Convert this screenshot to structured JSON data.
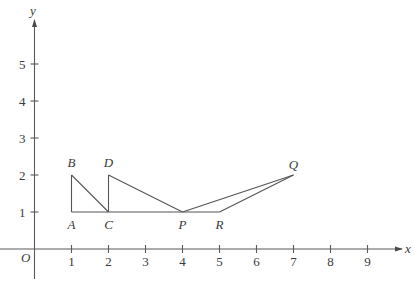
{
  "figure": {
    "axes": {
      "x_label": "x",
      "y_label": "y",
      "origin_label": "O",
      "x_ticks": [
        "1",
        "2",
        "3",
        "4",
        "5",
        "6",
        "7",
        "8",
        "9"
      ],
      "y_ticks": [
        "1",
        "2",
        "3",
        "4",
        "5"
      ]
    },
    "points": [
      {
        "label": "A",
        "x": 1,
        "y": 1
      },
      {
        "label": "B",
        "x": 1,
        "y": 2
      },
      {
        "label": "C",
        "x": 2,
        "y": 1
      },
      {
        "label": "D",
        "x": 2,
        "y": 2
      },
      {
        "label": "P",
        "x": 4,
        "y": 1
      },
      {
        "label": "Q",
        "x": 7,
        "y": 2
      },
      {
        "label": "R",
        "x": 5,
        "y": 1
      }
    ],
    "segments": [
      [
        "A",
        "B"
      ],
      [
        "B",
        "C"
      ],
      [
        "A",
        "C"
      ],
      [
        "C",
        "D"
      ],
      [
        "D",
        "P"
      ],
      [
        "C",
        "P"
      ],
      [
        "P",
        "R"
      ],
      [
        "P",
        "Q"
      ],
      [
        "R",
        "Q"
      ]
    ],
    "colors": {
      "line": "#555555",
      "axis": "#5a5a5a",
      "text": "#3a3a3a",
      "background": "#ffffff"
    }
  }
}
